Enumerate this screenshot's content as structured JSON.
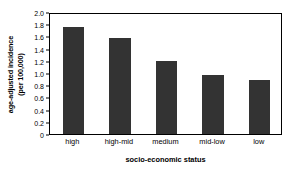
{
  "chart_data": {
    "type": "bar",
    "title": "",
    "categories": [
      "high",
      "high-mid",
      "medium",
      "mid-low",
      "low"
    ],
    "values": [
      1.76,
      1.57,
      1.2,
      0.96,
      0.88
    ],
    "xlabel": "socio-economic status",
    "ylabel_line1": "age-adjusted incidence",
    "ylabel_line2": "(per 100,000)",
    "ylim": [
      0,
      2.0
    ],
    "ytick_labels": [
      "0",
      "0.2",
      "0.4",
      "0.6",
      "0.8",
      "1.0",
      "1.2",
      "1.4",
      "1.6",
      "1.8",
      "2.0"
    ],
    "ytick_values": [
      0,
      0.2,
      0.4,
      0.6,
      0.8,
      1.0,
      1.2,
      1.4,
      1.6,
      1.8,
      2.0
    ],
    "grid": false,
    "legend": "none",
    "bar_color": "#333333",
    "frame_color": "#000000",
    "background_color": "#ffffff"
  }
}
